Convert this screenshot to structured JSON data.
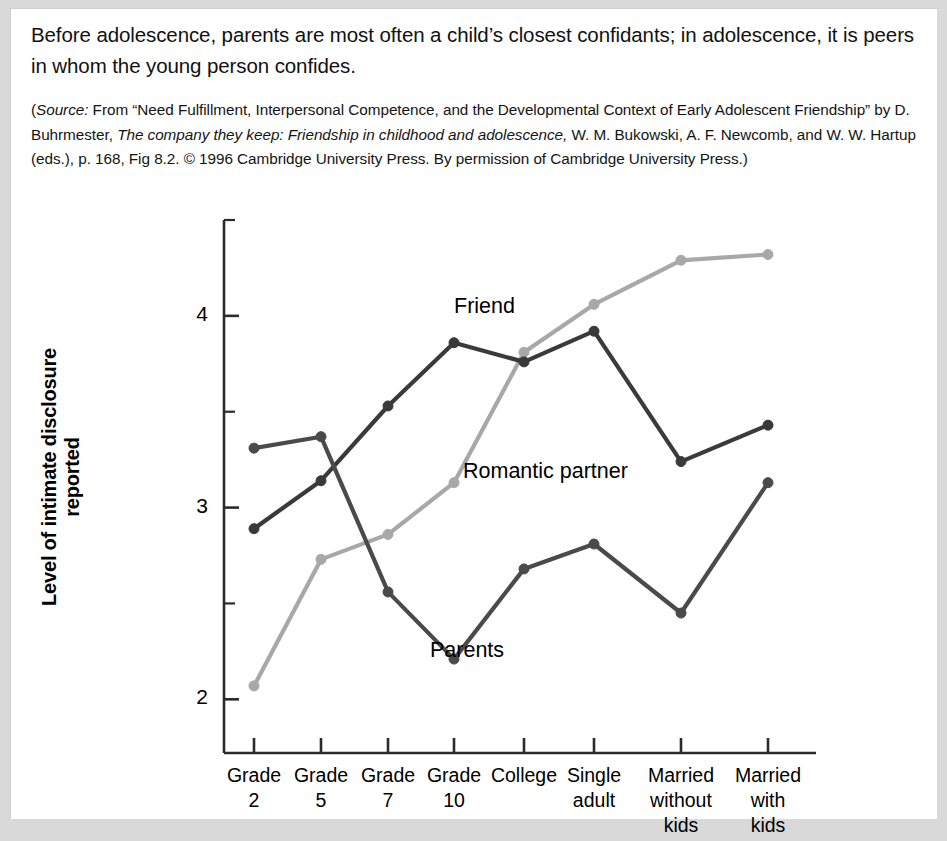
{
  "caption": {
    "main_text": "Before adolescence, parents are most often a child’s closest confidants; in adolescence, it is peers in whom the young person confides.",
    "source_prefix": "(",
    "source_word": "Source:",
    "source_part1": " From “Need Fulfillment, Interpersonal Competence, and the Developmental Context of Early Adolescent Friendship” by D. Buhrmester, ",
    "source_italic": "The company they keep: Friendship in childhood and adolescence,",
    "source_part2": " W. M. Bukowski, A. F. Newcomb, and W. W. Hartup (eds.), p. 168, Fig 8.2. © 1996 Cambridge University Press. By permission of Cambridge University Press.)"
  },
  "chart_data": {
    "type": "line",
    "title": "",
    "xlabel": "",
    "ylabel": "Level of intimate disclosure reported",
    "categories": [
      "Grade\n2",
      "Grade\n5",
      "Grade\n7",
      "Grade\n10",
      "College",
      "Single\nadult",
      "Married\nwithout\nkids",
      "Married\nwith\nkids"
    ],
    "category_lines": [
      [
        "Grade",
        "2"
      ],
      [
        "Grade",
        "5"
      ],
      [
        "Grade",
        "7"
      ],
      [
        "Grade",
        "10"
      ],
      [
        "College"
      ],
      [
        "Single",
        "adult"
      ],
      [
        "Married",
        "without",
        "kids"
      ],
      [
        "Married",
        "with",
        "kids"
      ]
    ],
    "ylim": [
      1.72,
      4.5
    ],
    "yticks": [
      2,
      3,
      4
    ],
    "ytick_labels": [
      "2",
      "3",
      "4"
    ],
    "yminorticks": [
      2.5,
      3.5,
      4.5
    ],
    "grid": false,
    "legend_position": "inline-annotations",
    "series": [
      {
        "name": "Friend",
        "color": "#3a3a3a",
        "values": [
          2.89,
          3.14,
          3.53,
          3.86,
          3.76,
          3.92,
          3.24,
          3.43
        ],
        "label_x": 443,
        "label_y": 285
      },
      {
        "name": "Romantic partner",
        "color": "#a8a8a8",
        "values": [
          2.07,
          2.73,
          2.86,
          3.13,
          3.81,
          4.06,
          4.29,
          4.32
        ],
        "label_x": 452,
        "label_y": 450
      },
      {
        "name": "Parents",
        "color": "#4a4a4a",
        "values": [
          3.31,
          3.37,
          2.56,
          2.21,
          2.68,
          2.81,
          2.45,
          3.13
        ],
        "label_x": 419,
        "label_y": 629
      }
    ],
    "axis_color": "#2b2b2b",
    "marker_radius": 5
  }
}
